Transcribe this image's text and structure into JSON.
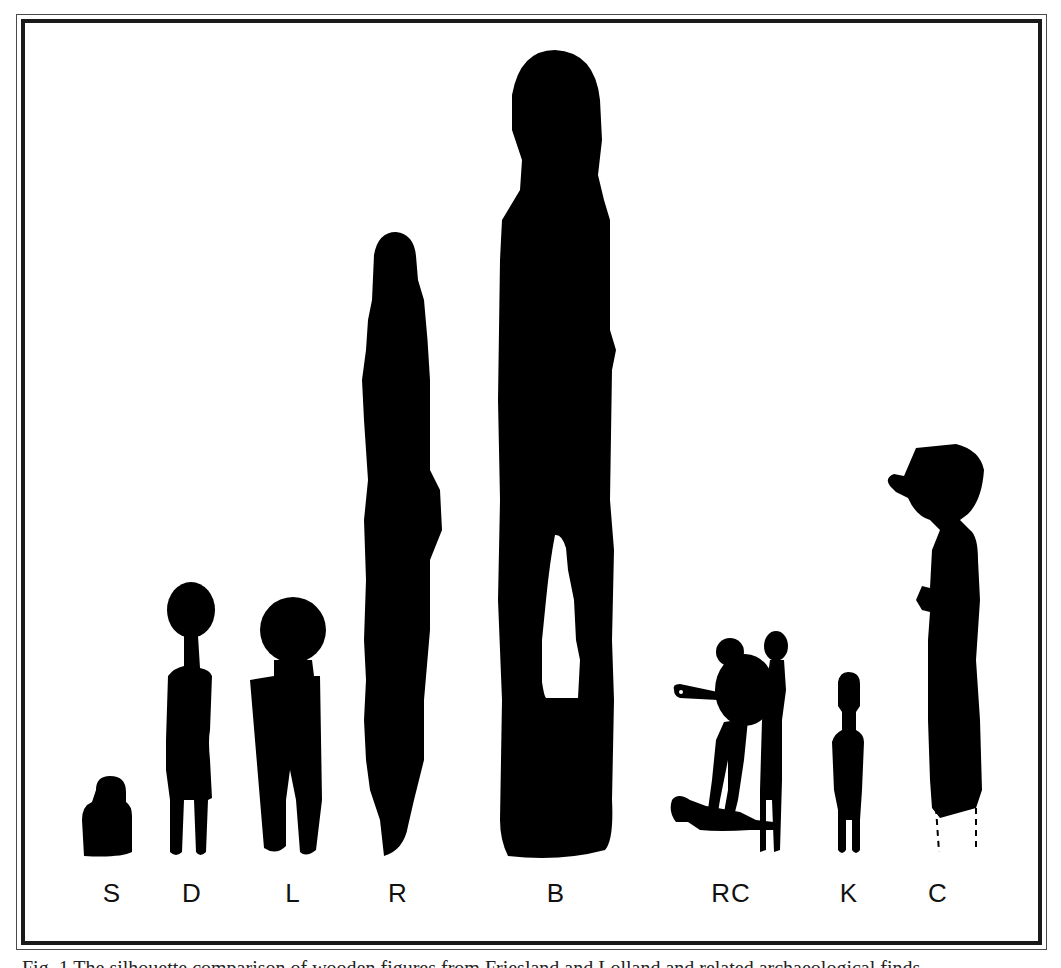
{
  "figure": {
    "labels": [
      "S",
      "D",
      "L",
      "R",
      "B",
      "RC",
      "K",
      "C"
    ],
    "caption": "Fig. 1 The silhouette comparison of wooden figures from Friesland and Lolland and related archaeological finds",
    "colors": {
      "silhouette": "#000000",
      "background": "#ffffff",
      "frame": "#1a1a1a"
    }
  }
}
